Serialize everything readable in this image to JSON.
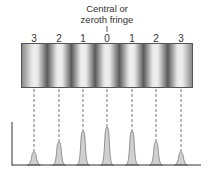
{
  "caption": {
    "line1": "Central or",
    "line2": "zeroth fringe"
  },
  "fringes": [
    {
      "order": "3",
      "x": 34,
      "peak_top": 152
    },
    {
      "order": "2",
      "x": 59,
      "peak_top": 142
    },
    {
      "order": "1",
      "x": 83,
      "peak_top": 131
    },
    {
      "order": "0",
      "x": 107,
      "peak_top": 127
    },
    {
      "order": "1",
      "x": 132,
      "peak_top": 131
    },
    {
      "order": "2",
      "x": 156,
      "peak_top": 142
    },
    {
      "order": "3",
      "x": 181,
      "peak_top": 152
    }
  ],
  "colors": {
    "peak_fill": "#d0d0d0",
    "peak_stroke": "#7a7a7a",
    "axis": "#333333",
    "dash": "#555555"
  }
}
